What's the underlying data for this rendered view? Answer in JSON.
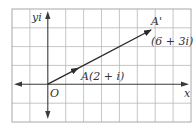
{
  "figure": {
    "type": "complex-plane-diagram",
    "grid": {
      "columns": 10,
      "rows": 6,
      "origin_column": 2,
      "origin_row": 4
    },
    "axes": {
      "real_label": "x",
      "imaginary_label": "yi",
      "origin_label": "O"
    },
    "points": [
      {
        "name": "A",
        "label": "A(2 + i)",
        "re": 2,
        "im": 1
      },
      {
        "name": "A'",
        "label": "A'",
        "value_label": "(6 + 3i)",
        "re": 6,
        "im": 3
      }
    ],
    "vector": {
      "from": "O",
      "to": "A'",
      "midpoint_arrow_at": "A"
    },
    "colors": {
      "grid": "#b8b8b8",
      "axis": "#3a3a3a",
      "vector": "#2a2a2a",
      "text": "#333333"
    }
  }
}
